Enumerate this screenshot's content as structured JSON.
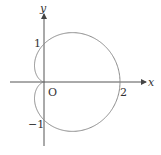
{
  "diagram": {
    "type": "polar-curve",
    "curve": "cardioid r = 1 + cos θ",
    "axes": {
      "x_label": "x",
      "y_label": "y",
      "origin_label": "O"
    },
    "tick_labels": {
      "x_2": "2",
      "y_1": "1",
      "y_neg1": "−1"
    },
    "colors": {
      "axis": "#444444",
      "curve": "#888888",
      "text": "#333333"
    }
  }
}
